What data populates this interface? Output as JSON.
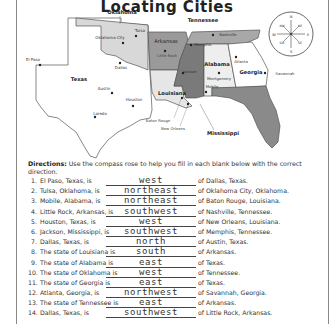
{
  "title": "Locating Cities",
  "map": {
    "states": [
      {
        "name": "Oklahoma",
        "shade": "#d8d8d8"
      },
      {
        "name": "Texas",
        "shade": "#ffffff"
      },
      {
        "name": "Arkansas",
        "shade": "#9a9a9a"
      },
      {
        "name": "Louisiana",
        "shade": "#e6e6e6"
      },
      {
        "name": "Mississippi",
        "shade": "#7a7a7a"
      },
      {
        "name": "Alabama",
        "shade": "#eeeeee"
      },
      {
        "name": "Tennessee",
        "shade": "#a8a8a8"
      },
      {
        "name": "Georgia",
        "shade": "#ffffff"
      },
      {
        "name": "Florida",
        "shade": "#8a8a8a"
      }
    ],
    "state_labels": {
      "oklahoma": "Oklahoma",
      "texas": "Texas",
      "arkansas": "Arkansas",
      "louisiana": "Louisiana",
      "mississippi": "Mississippi",
      "alabama": "Alabama",
      "tennessee": "Tennessee",
      "georgia": "Georgia"
    },
    "cities": {
      "el_paso": "El Paso",
      "dallas": "Dallas",
      "austin": "Austin",
      "houston": "Houston",
      "laredo": "Laredo",
      "tulsa": "Tulsa",
      "oklahoma_city": "Oklahoma City",
      "little_rock": "Little Rock",
      "memphis": "Memphis",
      "nashville": "Nashville",
      "jackson": "Jackson",
      "baton_rouge": "Baton Rouge",
      "new_orleans": "New Orleans",
      "montgomery": "Montgomery",
      "mobile": "Mobile",
      "atlanta": "Atlanta",
      "savannah": "Savannah"
    },
    "compass": {
      "n": "N",
      "s": "S",
      "e": "E",
      "w": "W",
      "ne": "NE",
      "nw": "NW",
      "se": "SE",
      "sw": "SW"
    }
  },
  "directions": {
    "label": "Directions:",
    "text": " Use the compass rose to help you fill in each blank below with the correct direction."
  },
  "questions": [
    {
      "num": "1.",
      "stem": "El Paso, Texas, is",
      "answer": "west",
      "tail": "of Dallas, Texas."
    },
    {
      "num": "2.",
      "stem": "Tulsa, Oklahoma, is",
      "answer": "northeast",
      "tail": "of Oklahoma City, Oklahoma."
    },
    {
      "num": "3.",
      "stem": "Mobile, Alabama, is",
      "answer": "northeast",
      "tail": "of Baton Rouge, Louisiana."
    },
    {
      "num": "4.",
      "stem": "Little Rock, Arkansas, is",
      "answer": "southwest",
      "tail": "of Nashville, Tennessee."
    },
    {
      "num": "5.",
      "stem": "Houston, Texas, is",
      "answer": "west",
      "tail": "of New Orleans, Louisiana."
    },
    {
      "num": "6.",
      "stem": "Jackson, Mississippi, is",
      "answer": "southwest",
      "tail": "of Memphis, Tennessee."
    },
    {
      "num": "7.",
      "stem": "Dallas, Texas, is",
      "answer": "north",
      "tail": "of Austin, Texas."
    },
    {
      "num": "8.",
      "stem": "The state of Louisiana is",
      "answer": "south",
      "tail": "of Arkansas."
    },
    {
      "num": "9.",
      "stem": "The state of Alabama is",
      "answer": "east",
      "tail": "of Texas."
    },
    {
      "num": "10.",
      "stem": "The state of Oklahoma is",
      "answer": "west",
      "tail": "of Tennessee."
    },
    {
      "num": "11.",
      "stem": "The state of Georgia is",
      "answer": "east",
      "tail": "of Texas."
    },
    {
      "num": "12.",
      "stem": "Atlanta, Georgia, is",
      "answer": "northwest",
      "tail": "of Savannah, Georgia."
    },
    {
      "num": "13.",
      "stem": "The state of Tennessee is",
      "answer": "east",
      "tail": "of Arkansas."
    },
    {
      "num": "14.",
      "stem": "Dallas, Texas, is",
      "answer": "southwest",
      "tail": "of Little Rock, Arkansas."
    }
  ]
}
